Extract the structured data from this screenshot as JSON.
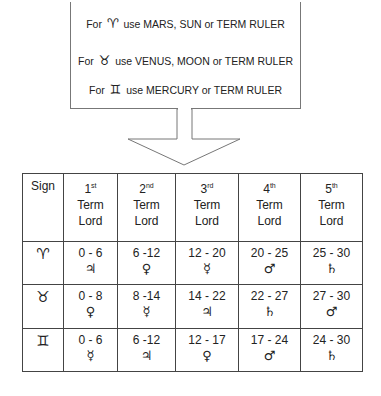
{
  "note": {
    "lines": [
      {
        "prefix": "For",
        "symbol": "♈",
        "text": "use MARS, SUN or TERM RULER"
      },
      {
        "prefix": "For",
        "symbol": "♉",
        "text": "use VENUS, MOON or TERM RULER"
      },
      {
        "prefix": "For",
        "symbol": "♊",
        "text": "use MERCURY or TERM RULER"
      }
    ]
  },
  "table": {
    "headers": [
      {
        "label": "Sign"
      },
      {
        "num": "1",
        "suffix": "st",
        "line2": "Term",
        "line3": "Lord"
      },
      {
        "num": "2",
        "suffix": "nd",
        "line2": "Term",
        "line3": "Lord"
      },
      {
        "num": "3",
        "suffix": "rd",
        "line2": "Term",
        "line3": "Lord"
      },
      {
        "num": "4",
        "suffix": "th",
        "line2": "Term",
        "line3": "Lord"
      },
      {
        "num": "5",
        "suffix": "th",
        "line2": "Term",
        "line3": "Lord"
      }
    ],
    "rows": [
      {
        "sign": "♈",
        "cells": [
          {
            "range": "0 - 6",
            "planet": "♃"
          },
          {
            "range": "6 -12",
            "planet": "♀"
          },
          {
            "range": "12 - 20",
            "planet": "☿"
          },
          {
            "range": "20 - 25",
            "planet": "♂"
          },
          {
            "range": "25 - 30",
            "planet": "♄"
          }
        ]
      },
      {
        "sign": "♉",
        "cells": [
          {
            "range": "0 - 8",
            "planet": "♀"
          },
          {
            "range": "8 -14",
            "planet": "☿"
          },
          {
            "range": "14 - 22",
            "planet": "♃"
          },
          {
            "range": "22 - 27",
            "planet": "♄"
          },
          {
            "range": "27 - 30",
            "planet": "♂"
          }
        ]
      },
      {
        "sign": "♊",
        "cells": [
          {
            "range": "0 - 6",
            "planet": "☿"
          },
          {
            "range": "6 -12",
            "planet": "♃"
          },
          {
            "range": "12 - 17",
            "planet": "♀"
          },
          {
            "range": "17 - 24",
            "planet": "♂"
          },
          {
            "range": "24 - 30",
            "planet": "♄"
          }
        ]
      }
    ]
  }
}
